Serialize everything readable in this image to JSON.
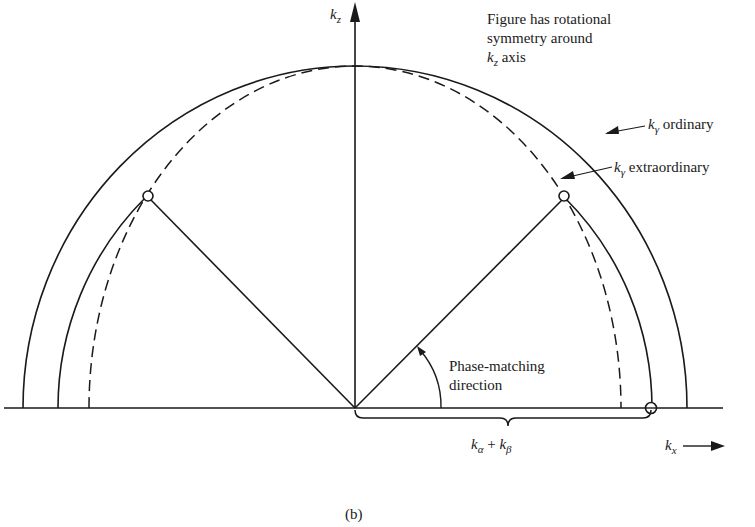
{
  "figure": {
    "caption": "(b)",
    "note_lines": [
      "Figure has rotational",
      "symmetry around",
      "axis"
    ],
    "note_axis_symbol": "k",
    "note_axis_sub": "z"
  },
  "axes": {
    "vertical": {
      "symbol": "k",
      "sub": "z"
    },
    "horizontal": {
      "symbol": "k",
      "sub": "x"
    }
  },
  "labels": {
    "ordinary": {
      "symbol": "k",
      "sub": "γ",
      "text": "ordinary"
    },
    "extraordinary": {
      "symbol": "k",
      "sub": "γ",
      "text": "extraordinary"
    },
    "phase_matching": [
      "Phase-matching",
      "direction"
    ],
    "sum": {
      "a": "k",
      "a_sub": "α",
      "plus": "+",
      "b": "k",
      "b_sub": "β"
    }
  },
  "geometry": {
    "origin": [
      355,
      408
    ],
    "outer_circle_rx": 332,
    "outer_circle_ry": 342,
    "dashed_ellipse_rx": 268,
    "dashed_ellipse_ry": 342,
    "pump_circle_radius": 297,
    "phase_match_angle_deg": 45,
    "line_color": "#1a1a1a"
  }
}
